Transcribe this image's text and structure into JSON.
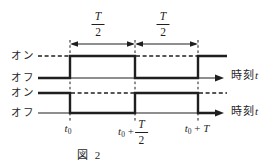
{
  "figure": {
    "caption": "図 2",
    "background_color": "#ffffff",
    "line_color": "#1f1f1f"
  },
  "waveform_top": {
    "on_label": "オン",
    "off_label": "オフ",
    "axis_label_kanji": "時刻",
    "axis_label_var": "t"
  },
  "waveform_bottom": {
    "on_label": "オン",
    "off_label": "オフ",
    "axis_label_kanji": "時刻",
    "axis_label_var": "t"
  },
  "intervals": {
    "first": {
      "num": "T",
      "den": "2"
    },
    "second": {
      "num": "T",
      "den": "2"
    }
  },
  "ticks": {
    "t0": {
      "base": "t",
      "sub": "0"
    },
    "t0_half": {
      "base": "t",
      "sub": "0",
      "plus": "+",
      "num": "T",
      "den": "2"
    },
    "t0_T": {
      "base": "t",
      "sub": "0",
      "plus": "+",
      "end": "T"
    }
  }
}
